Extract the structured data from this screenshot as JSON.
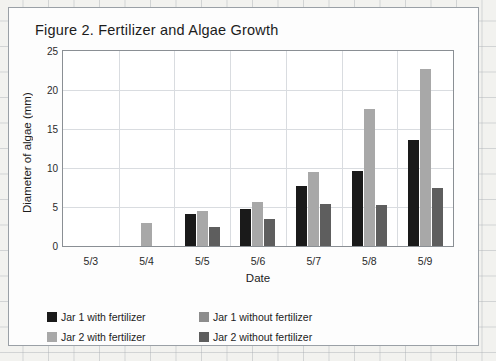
{
  "figure": {
    "title": "Figure 2. Fertilizer and Algae Growth"
  },
  "chart_data": {
    "type": "bar",
    "title": "Figure 2. Fertilizer and Algae Growth",
    "xlabel": "Date",
    "ylabel": "Diameter of algae (mm)",
    "categories": [
      "5/3",
      "5/4",
      "5/5",
      "5/6",
      "5/7",
      "5/8",
      "5/9"
    ],
    "ylim": [
      0,
      25
    ],
    "yticks": [
      0,
      5,
      10,
      15,
      20,
      25
    ],
    "grid": true,
    "legend_position": "bottom",
    "series": [
      {
        "name": "Jar 1 with fertilizer",
        "color": "#1a1a1a",
        "values": [
          0,
          0,
          4.1,
          4.7,
          7.7,
          9.6,
          13.6
        ]
      },
      {
        "name": "Jar 2 with fertilizer",
        "color": "#a8a8a8",
        "values": [
          0,
          2.9,
          4.5,
          5.7,
          9.5,
          17.6,
          22.7
        ]
      },
      {
        "name": "Jar 1 without fertilizer",
        "color": "#8d8d8d",
        "values": [
          0,
          0,
          0,
          0,
          0,
          0,
          0
        ]
      },
      {
        "name": "Jar 2 without fertilizer",
        "color": "#5e5e5e",
        "values": [
          0,
          0,
          2.4,
          3.4,
          5.4,
          5.3,
          7.5
        ]
      }
    ],
    "legend": [
      {
        "label": "Jar 1 with fertilizer",
        "color": "#1a1a1a"
      },
      {
        "label": "Jar 1 without fertilizer",
        "color": "#8d8d8d"
      },
      {
        "label": "Jar 2 with fertilizer",
        "color": "#a8a8a8"
      },
      {
        "label": "Jar 2 without fertilizer",
        "color": "#5e5e5e"
      }
    ]
  }
}
